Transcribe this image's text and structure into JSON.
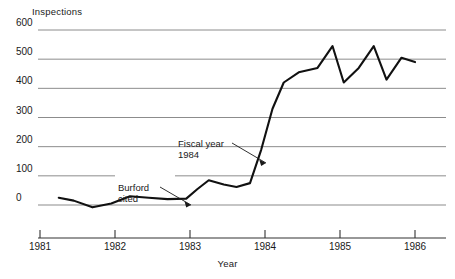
{
  "chart_data": {
    "type": "line",
    "title": "",
    "xlabel": "Year",
    "ylabel": "Inspections",
    "xlim": [
      1981.0,
      1986.2
    ],
    "ylim": [
      0,
      600
    ],
    "grid": true,
    "legend": "none",
    "y_ticks": [
      600,
      500,
      400,
      300,
      200,
      100,
      0
    ],
    "x_ticks": [
      1981,
      1982,
      1983,
      1984,
      1985,
      1986
    ],
    "series": [
      {
        "name": "Inspections",
        "color": "#111111",
        "x": [
          1981.25,
          1981.45,
          1981.7,
          1981.95,
          1982.2,
          1982.45,
          1982.7,
          1982.95,
          1983.1,
          1983.25,
          1983.45,
          1983.62,
          1983.8,
          1983.95,
          1984.1,
          1984.25,
          1984.45,
          1984.7,
          1984.9,
          1985.05,
          1985.25,
          1985.45,
          1985.62,
          1985.82,
          1986.0
        ],
        "y": [
          25,
          15,
          -8,
          5,
          30,
          25,
          20,
          22,
          55,
          85,
          70,
          62,
          75,
          190,
          330,
          420,
          455,
          470,
          545,
          420,
          470,
          545,
          430,
          505,
          490
        ]
      }
    ],
    "annotations": [
      {
        "name": "burford-cited",
        "text_line1": "Burford",
        "text_line2": "cited",
        "target_x": 1983.0,
        "target_y": 25
      },
      {
        "name": "fiscal-year-1984",
        "text_line1": "Fiscal year",
        "text_line2": "1984",
        "target_x": 1983.98,
        "target_y": 200
      }
    ]
  },
  "axes": {
    "y_title": "Inspections",
    "x_title": "Year",
    "y_tick_labels": [
      "600",
      "500",
      "400",
      "300",
      "200",
      "100",
      "0"
    ],
    "x_tick_labels": [
      "1981",
      "1982",
      "1983",
      "1984",
      "1985",
      "1986"
    ]
  },
  "annotations": {
    "burford": {
      "line1": "Burford",
      "line2": "cited"
    },
    "fiscal": {
      "line1": "Fiscal year",
      "line2": "1984"
    }
  },
  "colors": {
    "line": "#111111",
    "grid": "#8c8c8c",
    "axis": "#333333",
    "text": "#1a1a1a",
    "background": "#ffffff"
  }
}
